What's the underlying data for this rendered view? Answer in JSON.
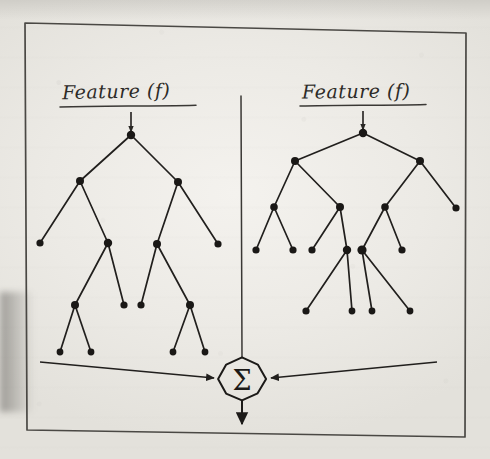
{
  "figure": {
    "medium": "pencil on paper photograph",
    "ink_color": "#211f1d",
    "paper_color": "#eceae5",
    "border": {
      "name": "hand-drawn rectangular frame",
      "points": "25,23 466,33 465,437 27,430"
    }
  },
  "labels": {
    "left_feature": "Feature (f)",
    "right_feature": "Feature (f)",
    "sum_symbol": "Σ"
  },
  "divider": {
    "name": "vertical separator between the two trees",
    "x": 241,
    "y_top": 96,
    "y_bottom": 358
  },
  "left_tree": {
    "name": "left decision tree",
    "input_arrow": {
      "x": 131,
      "y_top": 112,
      "y_bottom": 132
    },
    "nodes": [
      {
        "id": "L0",
        "x": 131,
        "y": 135,
        "r": 4.2,
        "level": 0
      },
      {
        "id": "L1",
        "x": 80,
        "y": 181,
        "r": 4.0,
        "level": 1
      },
      {
        "id": "L2",
        "x": 178,
        "y": 182,
        "r": 4.0,
        "level": 1
      },
      {
        "id": "L3",
        "x": 40,
        "y": 243,
        "r": 3.6,
        "level": 2
      },
      {
        "id": "L4",
        "x": 108,
        "y": 243,
        "r": 4.2,
        "level": 2
      },
      {
        "id": "L5",
        "x": 157,
        "y": 244,
        "r": 4.0,
        "level": 2
      },
      {
        "id": "L6",
        "x": 218,
        "y": 244,
        "r": 3.6,
        "level": 2
      },
      {
        "id": "L7",
        "x": 75,
        "y": 305,
        "r": 4.0,
        "level": 3
      },
      {
        "id": "L8",
        "x": 124,
        "y": 305,
        "r": 3.6,
        "level": 3
      },
      {
        "id": "L9",
        "x": 141,
        "y": 305,
        "r": 3.6,
        "level": 3
      },
      {
        "id": "L10",
        "x": 190,
        "y": 305,
        "r": 4.0,
        "level": 3
      },
      {
        "id": "L11",
        "x": 60,
        "y": 352,
        "r": 3.4,
        "level": 4
      },
      {
        "id": "L12",
        "x": 91,
        "y": 352,
        "r": 3.4,
        "level": 4
      },
      {
        "id": "L13",
        "x": 173,
        "y": 352,
        "r": 3.4,
        "level": 4
      },
      {
        "id": "L14",
        "x": 205,
        "y": 352,
        "r": 3.4,
        "level": 4
      }
    ],
    "edges": [
      [
        "L0",
        "L1"
      ],
      [
        "L0",
        "L2"
      ],
      [
        "L1",
        "L3"
      ],
      [
        "L1",
        "L4"
      ],
      [
        "L2",
        "L5"
      ],
      [
        "L2",
        "L6"
      ],
      [
        "L4",
        "L7"
      ],
      [
        "L4",
        "L8"
      ],
      [
        "L5",
        "L9"
      ],
      [
        "L5",
        "L10"
      ],
      [
        "L7",
        "L11"
      ],
      [
        "L7",
        "L12"
      ],
      [
        "L10",
        "L13"
      ],
      [
        "L10",
        "L14"
      ]
    ],
    "output_arrow": {
      "x_start": 40,
      "y_start": 362,
      "x_end": 214,
      "y_end": 378
    }
  },
  "right_tree": {
    "name": "right decision tree",
    "input_arrow": {
      "x": 363,
      "y_top": 111,
      "y_bottom": 130
    },
    "nodes": [
      {
        "id": "R0",
        "x": 363,
        "y": 133,
        "r": 4.2,
        "level": 0
      },
      {
        "id": "R1",
        "x": 295,
        "y": 161,
        "r": 4.0,
        "level": 1
      },
      {
        "id": "R2",
        "x": 420,
        "y": 161,
        "r": 4.0,
        "level": 1
      },
      {
        "id": "R3",
        "x": 274,
        "y": 207,
        "r": 3.8,
        "level": 2
      },
      {
        "id": "R4",
        "x": 340,
        "y": 207,
        "r": 4.0,
        "level": 2
      },
      {
        "id": "R5",
        "x": 385,
        "y": 207,
        "r": 3.8,
        "level": 2
      },
      {
        "id": "R6",
        "x": 456,
        "y": 208,
        "r": 3.6,
        "level": 2
      },
      {
        "id": "R7",
        "x": 256,
        "y": 250,
        "r": 3.6,
        "level": 3
      },
      {
        "id": "R8",
        "x": 293,
        "y": 250,
        "r": 3.6,
        "level": 3
      },
      {
        "id": "R9",
        "x": 312,
        "y": 250,
        "r": 3.6,
        "level": 3
      },
      {
        "id": "R10",
        "x": 347,
        "y": 250,
        "r": 4.2,
        "level": 3
      },
      {
        "id": "R11",
        "x": 362,
        "y": 250,
        "r": 4.6,
        "level": 3
      },
      {
        "id": "R12",
        "x": 402,
        "y": 250,
        "r": 3.6,
        "level": 3
      },
      {
        "id": "R13",
        "x": 306,
        "y": 311,
        "r": 3.6,
        "level": 4
      },
      {
        "id": "R14",
        "x": 352,
        "y": 311,
        "r": 3.4,
        "level": 4
      },
      {
        "id": "R15",
        "x": 372,
        "y": 311,
        "r": 3.4,
        "level": 4
      },
      {
        "id": "R16",
        "x": 410,
        "y": 311,
        "r": 3.4,
        "level": 4
      }
    ],
    "edges": [
      [
        "R0",
        "R1"
      ],
      [
        "R0",
        "R2"
      ],
      [
        "R1",
        "R3"
      ],
      [
        "R1",
        "R4"
      ],
      [
        "R2",
        "R5"
      ],
      [
        "R2",
        "R6"
      ],
      [
        "R3",
        "R7"
      ],
      [
        "R3",
        "R8"
      ],
      [
        "R4",
        "R9"
      ],
      [
        "R4",
        "R10"
      ],
      [
        "R5",
        "R11"
      ],
      [
        "R5",
        "R12"
      ],
      [
        "R10",
        "R13"
      ],
      [
        "R10",
        "R14"
      ],
      [
        "R11",
        "R15"
      ],
      [
        "R11",
        "R16"
      ]
    ],
    "output_arrow": {
      "x_start": 437,
      "y_start": 362,
      "x_end": 271,
      "y_end": 378
    }
  },
  "sum_node": {
    "name": "summation node",
    "cx": 242,
    "cy": 379,
    "rx": 23,
    "ry": 21,
    "output_arrow": {
      "x": 242,
      "y_top": 400,
      "y_bottom": 424
    }
  }
}
